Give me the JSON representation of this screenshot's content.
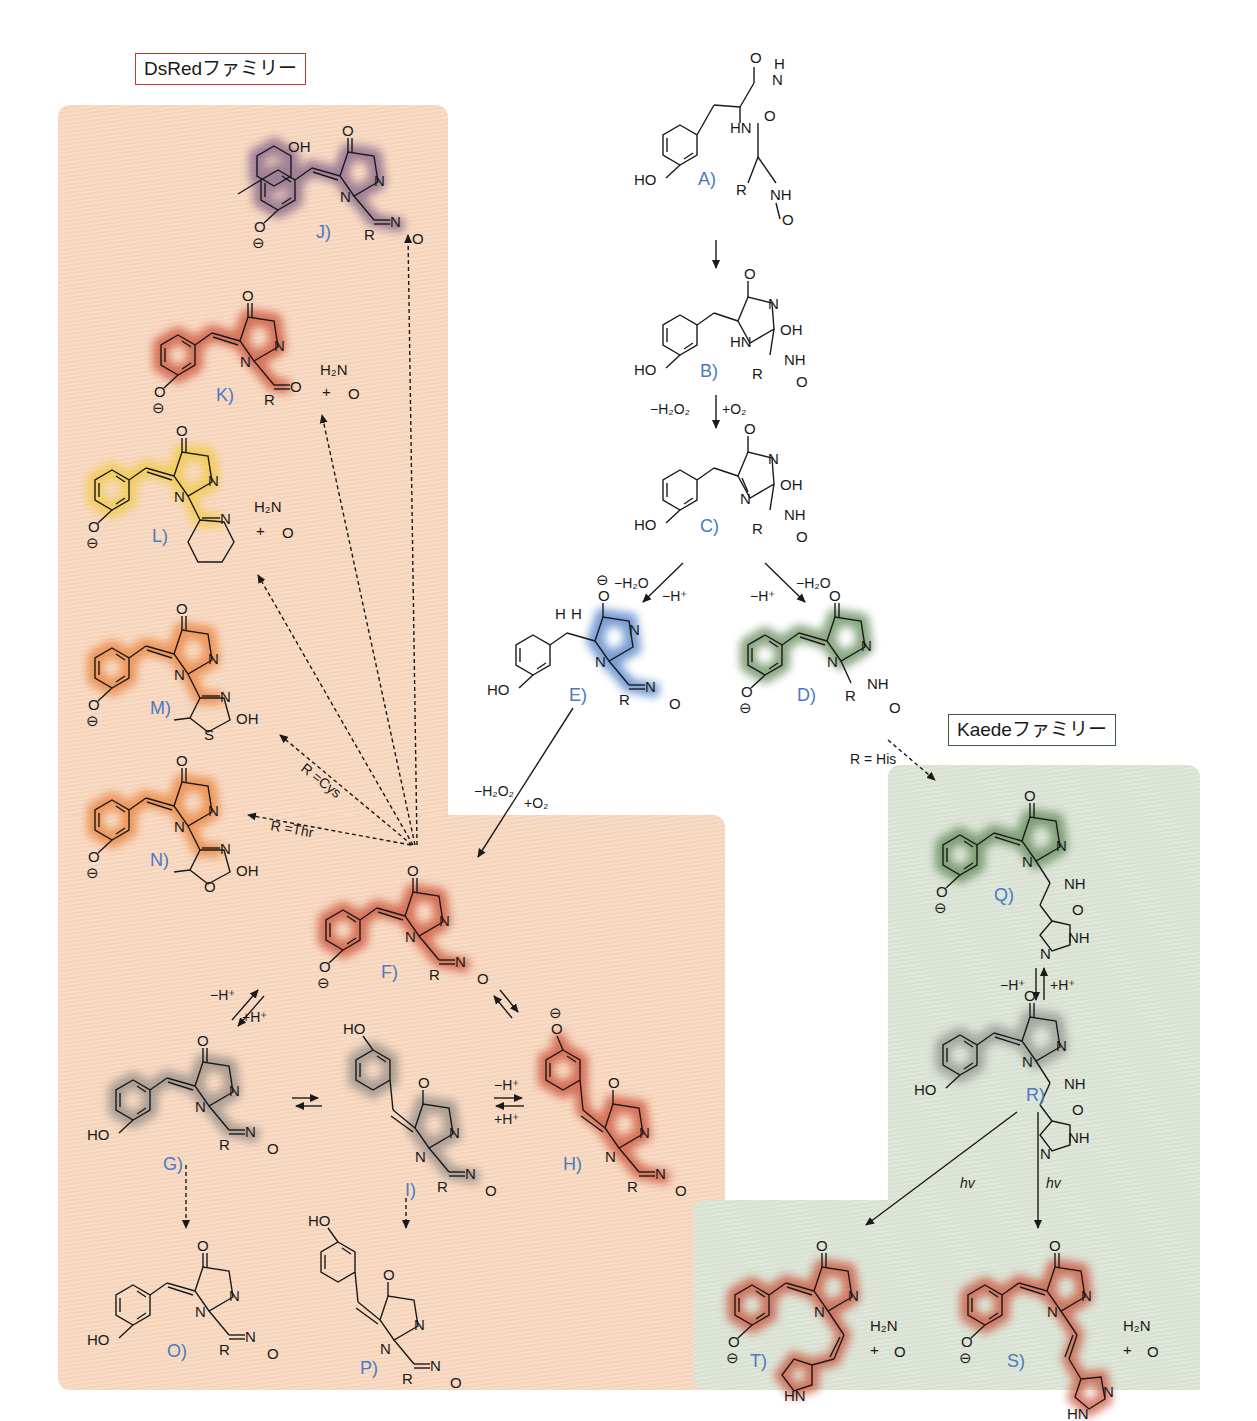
{
  "families": {
    "dsred": {
      "label": "DsRedファミリー",
      "color": "#f7d8c1",
      "border": "#c0392b"
    },
    "kaede": {
      "label": "Kaedeファミリー",
      "color": "#dce3d6",
      "border": "#3d5a3a"
    }
  },
  "highlight_colors": {
    "purple": "#7a5c84",
    "red": "#c8472e",
    "yellow": "#f0c93a",
    "orange": "#e97b32",
    "blue": "#4c7cc4",
    "green": "#5a8250",
    "gray": "#6f6f6f"
  },
  "compounds": [
    {
      "id": "A",
      "label": "A)",
      "highlight": "none"
    },
    {
      "id": "B",
      "label": "B)",
      "highlight": "none"
    },
    {
      "id": "C",
      "label": "C)",
      "highlight": "none"
    },
    {
      "id": "D",
      "label": "D)",
      "highlight": "green"
    },
    {
      "id": "E",
      "label": "E)",
      "highlight": "blue"
    },
    {
      "id": "F",
      "label": "F)",
      "highlight": "red"
    },
    {
      "id": "G",
      "label": "G)",
      "highlight": "gray"
    },
    {
      "id": "H",
      "label": "H)",
      "highlight": "red"
    },
    {
      "id": "I",
      "label": "I)",
      "highlight": "gray"
    },
    {
      "id": "J",
      "label": "J)",
      "highlight": "purple"
    },
    {
      "id": "K",
      "label": "K)",
      "highlight": "red"
    },
    {
      "id": "L",
      "label": "L)",
      "highlight": "yellow"
    },
    {
      "id": "M",
      "label": "M)",
      "highlight": "orange"
    },
    {
      "id": "N",
      "label": "N)",
      "highlight": "orange"
    },
    {
      "id": "O",
      "label": "O)",
      "highlight": "none"
    },
    {
      "id": "P",
      "label": "P)",
      "highlight": "none"
    },
    {
      "id": "Q",
      "label": "Q)",
      "highlight": "green"
    },
    {
      "id": "R",
      "label": "R)",
      "highlight": "gray"
    },
    {
      "id": "S",
      "label": "S)",
      "highlight": "red"
    },
    {
      "id": "T",
      "label": "T)",
      "highlight": "red"
    }
  ],
  "conditions": {
    "b_to_c_left": "−H₂O₂",
    "b_to_c_right": "+O₂",
    "c_to_e_a": "−H₂O",
    "c_to_e_b": "−H⁺",
    "c_to_d_a": "−H⁺",
    "c_to_d_b": "−H₂O",
    "e_to_f_a": "−H₂O₂",
    "e_to_f_b": "+O₂",
    "d_to_q": "R = His",
    "f_to_m": "R =Cys",
    "f_to_n": "R =Thr",
    "f_g_minus": "−H⁺",
    "f_g_plus": "+H⁺",
    "i_h_minus": "−H⁺",
    "i_h_plus": "+H⁺",
    "q_r_minus": "−H⁺",
    "q_r_plus": "+H⁺",
    "r_to_t": "hv",
    "r_to_s": "hv"
  },
  "atoms": {
    "HO": "HO",
    "OH": "OH",
    "O": "O",
    "N": "N",
    "NH": "NH",
    "HN": "HN",
    "R": "R",
    "S": "S",
    "H2N": "H₂N",
    "plus": "+",
    "minus": "⊖",
    "H": "H"
  }
}
